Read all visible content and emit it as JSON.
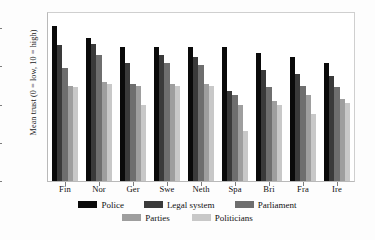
{
  "chart_data": {
    "type": "bar",
    "title": "",
    "xlabel": "",
    "ylabel": "Mean trust (0 = low, 10 = high)",
    "ylim": [
      0,
      8.8
    ],
    "yticks": [
      0,
      2,
      4,
      6,
      8
    ],
    "grid": false,
    "legend_position": "bottom",
    "categories": [
      "Fin",
      "Nor",
      "Ger",
      "Swe",
      "Neth",
      "Spa",
      "Bri",
      "Fra",
      "Ire"
    ],
    "series": [
      {
        "name": "Police",
        "color": "#0a0a0a",
        "values": [
          8.1,
          7.5,
          7.0,
          7.0,
          7.0,
          7.0,
          6.7,
          6.5,
          6.2
        ]
      },
      {
        "name": "Legal system",
        "color": "#3a3a3a",
        "values": [
          7.1,
          7.2,
          6.2,
          6.6,
          6.5,
          4.7,
          5.8,
          5.6,
          5.5
        ]
      },
      {
        "name": "Parliament",
        "color": "#6e6e6e",
        "values": [
          5.9,
          6.6,
          5.1,
          6.2,
          6.1,
          4.5,
          4.9,
          5.0,
          4.9
        ]
      },
      {
        "name": "Parties",
        "color": "#9e9e9e",
        "values": [
          5.0,
          5.2,
          5.0,
          5.1,
          5.1,
          4.0,
          4.2,
          4.5,
          4.3
        ]
      },
      {
        "name": "Politicians",
        "color": "#c8c8c8",
        "values": [
          4.9,
          5.1,
          4.0,
          5.0,
          5.0,
          2.6,
          4.0,
          3.5,
          4.1
        ]
      }
    ]
  },
  "axis": {
    "y_title": "Mean trust (0 = low, 10 = high)"
  },
  "legend": {
    "row1": [
      "Police",
      "Legal system",
      "Parliament"
    ],
    "row2": [
      "Parties",
      "Politicians"
    ]
  }
}
